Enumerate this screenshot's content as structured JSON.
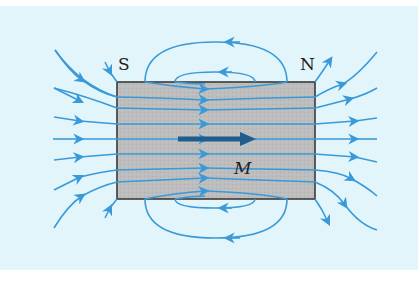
{
  "figure": {
    "labels": {
      "south": "S",
      "north": "N",
      "magnetization": "M"
    },
    "colors": {
      "panel": "#e2f5fb",
      "magnet_fill": "#bdbdbd",
      "magnet_border": "#3a3a3a",
      "field_line": "#3a9ad9",
      "magnetization_arrow": "#1f5e8c",
      "label_text": "#222222"
    },
    "magnet": {
      "x": 117,
      "y": 82,
      "width": 198,
      "height": 117
    },
    "field_line_count": {
      "left_external": 7,
      "right_external": 7,
      "corner_short": 4,
      "top_loops": 2,
      "bottom_loops": 2,
      "internal": 11
    }
  }
}
